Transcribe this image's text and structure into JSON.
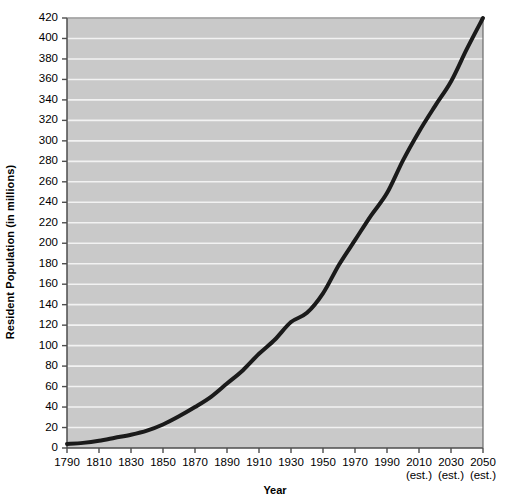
{
  "chart_data": {
    "type": "line",
    "title": "",
    "xlabel": "Year",
    "ylabel": "Resident Population (in millions)",
    "xlim": [
      1790,
      2050
    ],
    "ylim": [
      0,
      420
    ],
    "grid": true,
    "legend": "none",
    "x_tick_labels": [
      "1790",
      "1810",
      "1830",
      "1850",
      "1870",
      "1890",
      "1910",
      "1930",
      "1950",
      "1970",
      "1990",
      "2010",
      "2030",
      "2050"
    ],
    "x_tick_sublabels": [
      "",
      "",
      "",
      "",
      "",
      "",
      "",
      "",
      "",
      "",
      "",
      "(est.)",
      "(est.)",
      "(est.)"
    ],
    "y_tick_labels": [
      "0",
      "20",
      "40",
      "60",
      "80",
      "100",
      "120",
      "140",
      "160",
      "180",
      "200",
      "220",
      "240",
      "260",
      "280",
      "300",
      "320",
      "340",
      "360",
      "380",
      "400",
      "420"
    ],
    "y_ticks": [
      0,
      20,
      40,
      60,
      80,
      100,
      120,
      140,
      160,
      180,
      200,
      220,
      240,
      260,
      280,
      300,
      320,
      340,
      360,
      380,
      400,
      420
    ],
    "x": [
      1790,
      1800,
      1810,
      1820,
      1830,
      1840,
      1850,
      1860,
      1870,
      1880,
      1890,
      1900,
      1910,
      1920,
      1930,
      1940,
      1950,
      1960,
      1970,
      1980,
      1990,
      2000,
      2010,
      2020,
      2030,
      2040,
      2050
    ],
    "values": [
      4,
      5,
      7,
      10,
      13,
      17,
      23,
      31,
      40,
      50,
      63,
      76,
      92,
      106,
      123,
      132,
      151,
      179,
      203,
      227,
      249,
      281,
      309,
      334,
      358,
      390,
      420
    ],
    "series": [
      {
        "name": "Resident Population",
        "color": "#1a1a1a",
        "values": [
          4,
          5,
          7,
          10,
          13,
          17,
          23,
          31,
          40,
          50,
          63,
          76,
          92,
          106,
          123,
          132,
          151,
          179,
          203,
          227,
          249,
          281,
          309,
          334,
          358,
          390,
          420
        ]
      }
    ],
    "plot_bg": "#c9c9c9",
    "grid_color": "#f2f2f2",
    "axis_color": "#4d4d4d",
    "line_color": "#1a1a1a",
    "line_width": 4
  }
}
